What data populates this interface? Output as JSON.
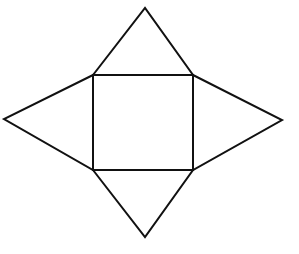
{
  "diagram": {
    "type": "net-of-square-pyramid",
    "title": "",
    "stroke_color": "#111111",
    "background_color": "#ffffff",
    "stroke_width": 2,
    "square_base": {
      "top_left": [
        93,
        75
      ],
      "top_right": [
        193,
        75
      ],
      "bottom_right": [
        193,
        170
      ],
      "bottom_left": [
        93,
        170
      ]
    },
    "triangles": [
      {
        "name": "top",
        "apex": [
          145,
          8
        ],
        "base": [
          [
            93,
            75
          ],
          [
            193,
            75
          ]
        ]
      },
      {
        "name": "right",
        "apex": [
          282,
          120
        ],
        "base": [
          [
            193,
            75
          ],
          [
            193,
            170
          ]
        ]
      },
      {
        "name": "bottom",
        "apex": [
          145,
          237
        ],
        "base": [
          [
            93,
            170
          ],
          [
            193,
            170
          ]
        ]
      },
      {
        "name": "left",
        "apex": [
          4,
          119
        ],
        "base": [
          [
            93,
            75
          ],
          [
            93,
            170
          ]
        ]
      }
    ]
  }
}
